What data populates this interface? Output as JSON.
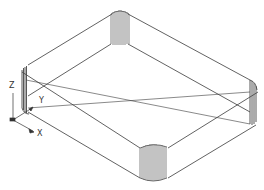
{
  "drawing": {
    "type": "isometric-wireframe",
    "subject": "rounded-rectangular-tray",
    "line_color": "#3a3a3a",
    "fin_color": "#555555",
    "background": "#ffffff"
  },
  "ucs_icon": {
    "z_label": "Z",
    "y_label": "Y",
    "x_label": "X"
  }
}
